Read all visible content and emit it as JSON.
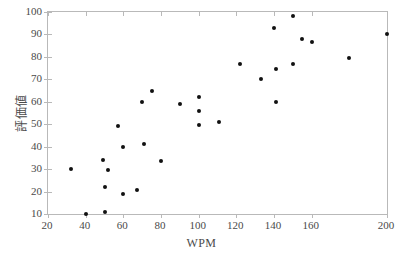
{
  "figure": {
    "background_color": "#ffffff",
    "frame_color": "#b9b9b9",
    "point_color": "#111111",
    "text_color": "#4a4a4a"
  },
  "chart_data": {
    "type": "scatter",
    "title": "",
    "xlabel": "WPM",
    "ylabel": "評価値",
    "xlim": [
      20,
      200
    ],
    "ylim": [
      10,
      100
    ],
    "xticks": [
      20,
      40,
      60,
      80,
      100,
      120,
      140,
      160,
      200
    ],
    "xtick_labels": [
      "20",
      "40",
      "60",
      "80",
      "100",
      "120",
      "140",
      "160",
      "200"
    ],
    "yticks": [
      10,
      20,
      30,
      40,
      50,
      60,
      70,
      80,
      90,
      100
    ],
    "ytick_labels": [
      "10",
      "20",
      "30",
      "40",
      "50",
      "60",
      "70",
      "80",
      "90",
      "100"
    ],
    "grid": false,
    "legend": null,
    "marker": "filled-circle",
    "points": [
      {
        "x": 32,
        "y": 30.0
      },
      {
        "x": 40,
        "y": 10.0
      },
      {
        "x": 49,
        "y": 34.0
      },
      {
        "x": 50,
        "y": 22.0
      },
      {
        "x": 50,
        "y": 11.0
      },
      {
        "x": 52,
        "y": 29.7
      },
      {
        "x": 57,
        "y": 49.0
      },
      {
        "x": 60,
        "y": 39.7
      },
      {
        "x": 60,
        "y": 19.0
      },
      {
        "x": 67,
        "y": 20.7
      },
      {
        "x": 70,
        "y": 60.0
      },
      {
        "x": 71,
        "y": 41.4
      },
      {
        "x": 75,
        "y": 65.0
      },
      {
        "x": 80,
        "y": 33.7
      },
      {
        "x": 90,
        "y": 59.0
      },
      {
        "x": 100,
        "y": 62.0
      },
      {
        "x": 100,
        "y": 56.0
      },
      {
        "x": 100,
        "y": 49.6
      },
      {
        "x": 111,
        "y": 51.0
      },
      {
        "x": 122,
        "y": 77.0
      },
      {
        "x": 133,
        "y": 70.0
      },
      {
        "x": 140,
        "y": 93.0
      },
      {
        "x": 141,
        "y": 74.7
      },
      {
        "x": 141,
        "y": 59.7
      },
      {
        "x": 150,
        "y": 98.0
      },
      {
        "x": 150,
        "y": 77.0
      },
      {
        "x": 155,
        "y": 88.0
      },
      {
        "x": 160,
        "y": 86.6
      },
      {
        "x": 180,
        "y": 79.7
      },
      {
        "x": 200,
        "y": 90.0
      }
    ]
  }
}
